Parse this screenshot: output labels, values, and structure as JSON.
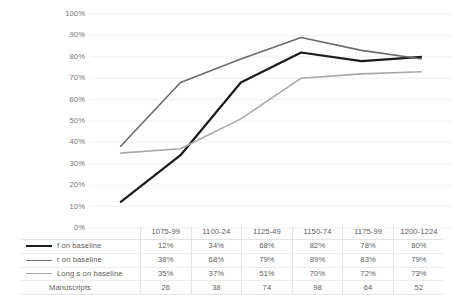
{
  "chart_data": {
    "type": "line",
    "title": "",
    "xlabel": "",
    "ylabel": "",
    "ylim": [
      0,
      100
    ],
    "grid": true,
    "legend_position": "table-left",
    "categories": [
      "1075-99",
      "1100-24",
      "1125-49",
      "1150-74",
      "1175-99",
      "1200-1224"
    ],
    "ytick_labels": [
      "100%",
      "90%",
      "80%",
      "70%",
      "60%",
      "50%",
      "40%",
      "30%",
      "20%",
      "10%",
      "0%"
    ],
    "ytick_values": [
      100,
      90,
      80,
      70,
      60,
      50,
      40,
      30,
      20,
      10,
      0
    ],
    "series": [
      {
        "name": "f on baseline",
        "color": "#1a1a1a",
        "width": 2.2,
        "values": [
          12,
          34,
          68,
          82,
          78,
          80
        ],
        "labels": [
          "12%",
          "34%",
          "68%",
          "82%",
          "78%",
          "80%"
        ]
      },
      {
        "name": "r on baseline",
        "color": "#6b6b6b",
        "width": 1.6,
        "values": [
          38,
          68,
          79,
          89,
          83,
          79
        ],
        "labels": [
          "38%",
          "68%",
          "79%",
          "89%",
          "83%",
          "79%"
        ]
      },
      {
        "name": "Long s on baseline",
        "color": "#a8a8a8",
        "width": 1.6,
        "values": [
          35,
          37,
          51,
          70,
          72,
          73
        ],
        "labels": [
          "35%",
          "37%",
          "51%",
          "70%",
          "72%",
          "73%"
        ]
      }
    ],
    "extra_rows": [
      {
        "name": "Manuscripts",
        "values": [
          26,
          38,
          74,
          98,
          64,
          52
        ],
        "labels": [
          "26",
          "38",
          "74",
          "98",
          "64",
          "52"
        ]
      }
    ]
  },
  "table": {
    "header_blank": "",
    "columns": [
      "1075-99",
      "1100-24",
      "1125-49",
      "1150-74",
      "1175-99",
      "1200-1224"
    ],
    "rows": [
      {
        "label": "f on baseline",
        "swatch": "line-swatch-black-icon",
        "cells": [
          "12%",
          "34%",
          "68%",
          "82%",
          "78%",
          "80%"
        ]
      },
      {
        "label": "r on baseline",
        "swatch": "line-swatch-gray-icon",
        "cells": [
          "38%",
          "68%",
          "79%",
          "89%",
          "83%",
          "79%"
        ]
      },
      {
        "label": "Long s on baseline",
        "swatch": "line-swatch-lightgray-icon",
        "cells": [
          "35%",
          "37%",
          "51%",
          "70%",
          "72%",
          "73%"
        ]
      },
      {
        "label": "Manuscripts",
        "swatch": "",
        "cells": [
          "26",
          "38",
          "74",
          "98",
          "64",
          "52"
        ]
      }
    ]
  },
  "colors": {
    "series_black": "#1a1a1a",
    "series_gray": "#6b6b6b",
    "series_lightgray": "#a8a8a8",
    "gridline": "#f0f0f0",
    "table_border": "#e3e3e3",
    "text": "#5d5d5d"
  }
}
